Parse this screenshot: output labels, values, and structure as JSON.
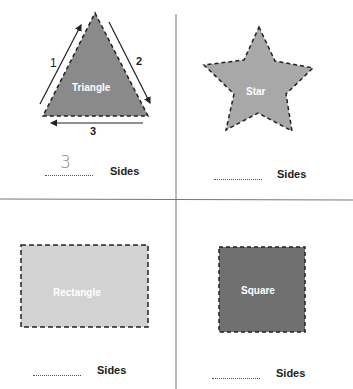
{
  "worksheet": {
    "title_partial": "",
    "suffix_label": "Sides",
    "cells": [
      {
        "shape": "triangle",
        "label": "Triangle",
        "fill": "#8a8a8a",
        "answer": "3",
        "side_numbers": [
          "1",
          "2",
          "3"
        ]
      },
      {
        "shape": "star",
        "label": "Star",
        "fill": "#a8a8a8",
        "answer": ""
      },
      {
        "shape": "rectangle",
        "label": "Rectangle",
        "fill": "#d2d2d2",
        "answer": ""
      },
      {
        "shape": "square",
        "label": "Square",
        "fill": "#707070",
        "answer": ""
      }
    ]
  },
  "labels": {
    "triangle": "Triangle",
    "star": "Star",
    "rectangle": "Rectangle",
    "square": "Square",
    "side1": "1",
    "side2": "2",
    "side3": "3",
    "sides": "Sides",
    "triangle_answer": "3"
  }
}
